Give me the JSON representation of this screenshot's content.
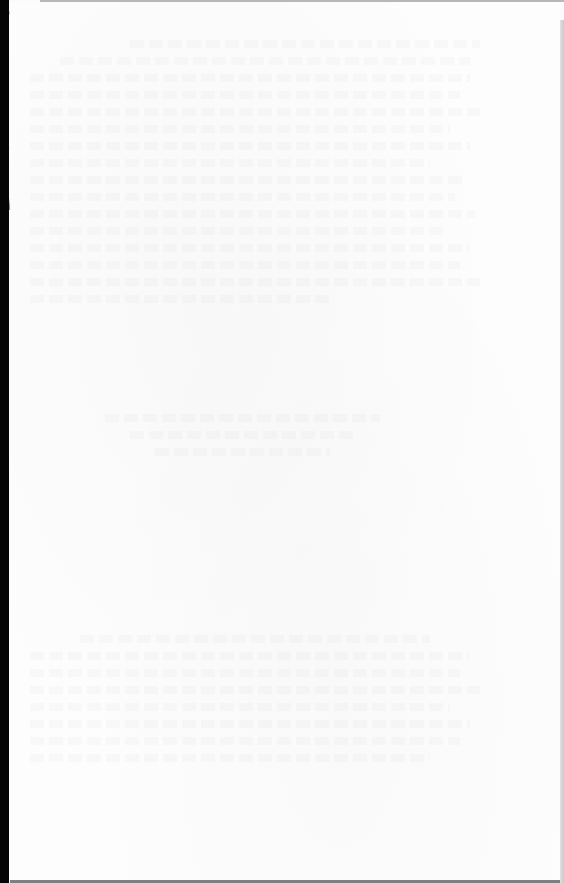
{
  "document": {
    "type": "scanned-book-page",
    "page_text": "",
    "state": "blank page with faint bleed-through from reverse side",
    "colors": {
      "paper": "#fdfdfd",
      "binding_edge": "#050505",
      "page_edges": "#8a8a8a"
    }
  }
}
